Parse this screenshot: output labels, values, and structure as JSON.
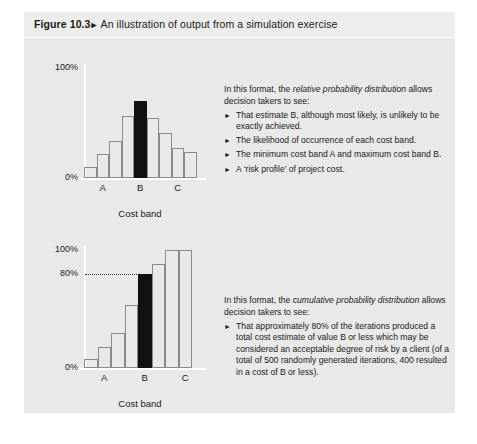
{
  "figure": {
    "number": "Figure 10.3",
    "arrow": "►",
    "caption": "An illustration of output from a simulation exercise",
    "panel_bg": "#e9e9e9",
    "header_bg": "#ededed",
    "highlight_color": "#111111",
    "bar_outline_color": "#8a8a8a",
    "axis_color": "#ffffff"
  },
  "chart_data": [
    {
      "id": "relative",
      "type": "bar",
      "title": "",
      "xlabel": "Cost band",
      "ylabel": "",
      "ylim": [
        0,
        100
      ],
      "ytick_labels": [
        "100%",
        "0%"
      ],
      "yticks": [
        100,
        0
      ],
      "grid": false,
      "legend": "none",
      "categories": [
        "1",
        "2",
        "3",
        "4",
        "5",
        "6",
        "7",
        "8",
        "9"
      ],
      "band_labels": [
        {
          "text": "A",
          "bar_index": 1
        },
        {
          "text": "B",
          "bar_index": 4
        },
        {
          "text": "C",
          "bar_index": 7
        }
      ],
      "values": [
        10,
        22,
        34,
        56,
        70,
        55,
        41,
        27,
        24
      ],
      "highlight_index": 4,
      "highlight_label": "B"
    },
    {
      "id": "cumulative",
      "type": "bar",
      "title": "",
      "xlabel": "Cost band",
      "ylabel": "",
      "ylim": [
        0,
        100
      ],
      "ytick_labels": [
        "100%",
        "80%",
        "0%"
      ],
      "yticks": [
        100,
        80,
        0
      ],
      "grid": false,
      "legend": "none",
      "categories": [
        "1",
        "2",
        "3",
        "4",
        "5",
        "6",
        "7",
        "8"
      ],
      "band_labels": [
        {
          "text": "A",
          "bar_index": 1
        },
        {
          "text": "B",
          "bar_index": 4
        },
        {
          "text": "C",
          "bar_index": 7
        }
      ],
      "values": [
        8,
        18,
        30,
        53,
        80,
        88,
        100,
        100
      ],
      "highlight_index": 4,
      "highlight_label": "B",
      "annotation": {
        "type": "leader-line",
        "value": 80,
        "label": "80%",
        "style": "dotted"
      }
    }
  ],
  "panels": {
    "relative": {
      "intro_before": "In this format, the ",
      "intro_emphasis": "relative probability distribution",
      "intro_after": " allows decision takers to see:",
      "bullet_marker": "►",
      "bullets": [
        "That estimate B, although most likely, is unlikely to be exactly achieved.",
        "The likelihood of occurrence of each cost band.",
        "The minimum cost band A and maximum cost band B.",
        "A ‘risk profile’ of project cost."
      ]
    },
    "cumulative": {
      "intro_before": "In this format, the ",
      "intro_emphasis": "cumulative probability distribution",
      "intro_after": " allows decision takers to see:",
      "bullet_marker": "►",
      "bullets": [
        "That approximately 80% of the iterations produced a total cost estimate of value B or less which may be considered an acceptable degree of risk by a client (of a total of 500 randomly generated iterations, 400 resulted in a cost of B or less)."
      ]
    }
  }
}
